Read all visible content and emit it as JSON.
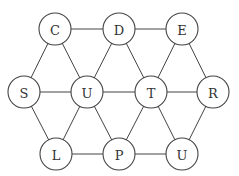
{
  "graph": {
    "node_radius": 16,
    "nodes": [
      {
        "id": "C",
        "label": "C",
        "x": 55,
        "y": 29
      },
      {
        "id": "D",
        "label": "D",
        "x": 119,
        "y": 29
      },
      {
        "id": "E",
        "label": "E",
        "x": 182,
        "y": 29
      },
      {
        "id": "S",
        "label": "S",
        "x": 24,
        "y": 92
      },
      {
        "id": "U1",
        "label": "U",
        "x": 87,
        "y": 92
      },
      {
        "id": "T",
        "label": "T",
        "x": 151,
        "y": 92
      },
      {
        "id": "R",
        "label": "R",
        "x": 213,
        "y": 92
      },
      {
        "id": "L",
        "label": "L",
        "x": 56,
        "y": 154
      },
      {
        "id": "P",
        "label": "P",
        "x": 119,
        "y": 154
      },
      {
        "id": "U2",
        "label": "U",
        "x": 182,
        "y": 154
      }
    ],
    "edges": [
      [
        "C",
        "D"
      ],
      [
        "D",
        "E"
      ],
      [
        "C",
        "S"
      ],
      [
        "C",
        "U1"
      ],
      [
        "D",
        "U1"
      ],
      [
        "D",
        "T"
      ],
      [
        "E",
        "T"
      ],
      [
        "E",
        "R"
      ],
      [
        "S",
        "U1"
      ],
      [
        "U1",
        "T"
      ],
      [
        "T",
        "R"
      ],
      [
        "S",
        "L"
      ],
      [
        "U1",
        "L"
      ],
      [
        "U1",
        "P"
      ],
      [
        "T",
        "P"
      ],
      [
        "T",
        "U2"
      ],
      [
        "R",
        "U2"
      ],
      [
        "L",
        "P"
      ],
      [
        "P",
        "U2"
      ]
    ]
  }
}
